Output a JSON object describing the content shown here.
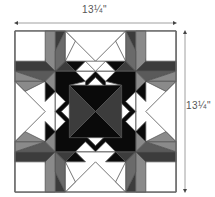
{
  "diagram": {
    "type": "quilt-block",
    "width_label": "13¼\"",
    "height_label": "13¼\"",
    "colors": {
      "black": "#0a0a0a",
      "dark_gray": "#3c3c3c",
      "mid_gray": "#6e6e6e",
      "light_gray": "#9a9a9a",
      "white": "#ffffff",
      "outline": "#555555",
      "dimension_line": "#888888"
    }
  }
}
